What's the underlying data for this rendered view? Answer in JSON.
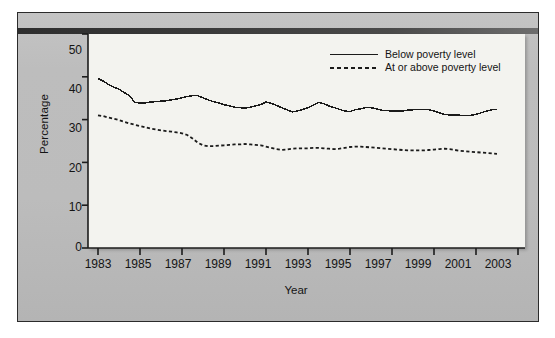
{
  "chart_data": {
    "type": "line",
    "title": "",
    "xlabel": "Year",
    "ylabel": "Percentage",
    "xlim": [
      1983,
      2003
    ],
    "ylim": [
      0,
      50
    ],
    "grid": false,
    "legend_position": "top-right",
    "x_ticks": [
      "1983",
      "1985",
      "1987",
      "1989",
      "1991",
      "1993",
      "1995",
      "1997",
      "1999",
      "2001",
      "2003"
    ],
    "y_ticks": [
      "0",
      "10",
      "20",
      "30",
      "40",
      "50"
    ],
    "series": [
      {
        "name": "Below poverty level",
        "style": "solid",
        "color": "#1a1a1a",
        "x": [
          1983.0,
          1983.25,
          1983.5,
          1983.75,
          1984.0,
          1984.25,
          1984.5,
          1984.75,
          1985.0,
          1985.25,
          1985.5,
          1985.75,
          1986.0,
          1986.25,
          1986.5,
          1986.75,
          1987.0,
          1987.25,
          1987.5,
          1987.75,
          1988.0,
          1988.25,
          1988.5,
          1988.75,
          1989.0,
          1989.25,
          1989.5,
          1989.75,
          1990.0,
          1990.25,
          1990.5,
          1990.75,
          1991.0,
          1991.25,
          1991.5,
          1991.75,
          1992.0,
          1992.25,
          1992.5,
          1992.75,
          1993.0,
          1993.25,
          1993.5,
          1993.75,
          1994.0,
          1994.25,
          1994.5,
          1994.75,
          1995.0,
          1995.25,
          1995.5,
          1995.75,
          1996.0,
          1996.25,
          1996.5,
          1996.75,
          1997.0,
          1997.25,
          1997.5,
          1997.75,
          1998.0,
          1998.25,
          1998.5,
          1998.75,
          1999.0,
          1999.25,
          1999.5,
          1999.75,
          2000.0,
          2000.25,
          2000.5,
          2000.75,
          2001.0,
          2001.25,
          2001.5,
          2001.75,
          2002.0
        ],
        "values": [
          39.6,
          39.0,
          38.2,
          37.6,
          37.1,
          36.3,
          35.6,
          34.0,
          33.9,
          33.9,
          34.1,
          34.2,
          34.3,
          34.4,
          34.6,
          34.8,
          35.1,
          35.4,
          35.6,
          35.6,
          35.1,
          34.6,
          34.2,
          33.9,
          33.5,
          33.2,
          32.9,
          32.8,
          32.7,
          32.9,
          33.2,
          33.5,
          34.1,
          33.8,
          33.3,
          32.8,
          32.3,
          31.8,
          32.0,
          32.4,
          32.8,
          33.4,
          34.0,
          33.7,
          33.2,
          32.8,
          32.4,
          32.0,
          31.9,
          32.3,
          32.5,
          32.8,
          32.8,
          32.5,
          32.2,
          32.1,
          32.0,
          32.0,
          32.0,
          32.2,
          32.3,
          32.4,
          32.4,
          32.3,
          32.0,
          31.6,
          31.2,
          31.1,
          31.1,
          31.0,
          31.0,
          31.0,
          31.2,
          31.6,
          32.0,
          32.3,
          32.4
        ]
      },
      {
        "name": "At or above poverty level",
        "style": "dotted",
        "color": "#1a1a1a",
        "x": [
          1983.0,
          1983.25,
          1983.5,
          1983.75,
          1984.0,
          1984.25,
          1984.5,
          1984.75,
          1985.0,
          1985.25,
          1985.5,
          1985.75,
          1986.0,
          1986.25,
          1986.5,
          1986.75,
          1987.0,
          1987.25,
          1987.5,
          1987.75,
          1988.0,
          1988.25,
          1988.5,
          1988.75,
          1989.0,
          1989.25,
          1989.5,
          1989.75,
          1990.0,
          1990.25,
          1990.5,
          1990.75,
          1991.0,
          1991.25,
          1991.5,
          1991.75,
          1992.0,
          1992.25,
          1992.5,
          1992.75,
          1993.0,
          1993.25,
          1993.5,
          1993.75,
          1994.0,
          1994.25,
          1994.5,
          1994.75,
          1995.0,
          1995.25,
          1995.5,
          1995.75,
          1996.0,
          1996.25,
          1996.5,
          1996.75,
          1997.0,
          1997.25,
          1997.5,
          1997.75,
          1998.0,
          1998.25,
          1998.5,
          1998.75,
          1999.0,
          1999.25,
          1999.5,
          1999.75,
          2000.0,
          2000.25,
          2000.5,
          2000.75,
          2001.0,
          2001.25,
          2001.5,
          2001.75,
          2002.0
        ],
        "values": [
          31.0,
          30.8,
          30.5,
          30.2,
          29.9,
          29.5,
          29.1,
          28.8,
          28.5,
          28.2,
          27.9,
          27.7,
          27.5,
          27.3,
          27.2,
          27.0,
          26.8,
          26.4,
          25.6,
          24.6,
          24.0,
          23.8,
          23.8,
          23.9,
          24.0,
          24.1,
          24.2,
          24.2,
          24.3,
          24.2,
          24.1,
          24.0,
          23.7,
          23.4,
          23.1,
          22.9,
          23.0,
          23.2,
          23.3,
          23.3,
          23.3,
          23.4,
          23.4,
          23.3,
          23.2,
          23.1,
          23.2,
          23.4,
          23.6,
          23.7,
          23.7,
          23.6,
          23.5,
          23.4,
          23.3,
          23.2,
          23.1,
          23.0,
          22.9,
          22.8,
          22.8,
          22.8,
          22.8,
          22.9,
          23.0,
          23.1,
          23.2,
          23.1,
          22.9,
          22.7,
          22.6,
          22.5,
          22.4,
          22.3,
          22.2,
          22.1,
          22.0
        ]
      }
    ]
  },
  "axes": {
    "y_label": "Percentage",
    "x_label": "Year",
    "y_ticks": [
      "50",
      "40",
      "30",
      "20",
      "10",
      "0"
    ],
    "x_ticks": [
      "1983",
      "1985",
      "1987",
      "1989",
      "1991",
      "1993",
      "1995",
      "1997",
      "1999",
      "2001",
      "2003"
    ]
  },
  "legend": {
    "items": [
      {
        "label": "Below poverty level",
        "style": "solid"
      },
      {
        "label": "At or above poverty level",
        "style": "dotted"
      }
    ]
  },
  "colors": {
    "line": "#1a1a1a",
    "plot_background": "#f3f3ef",
    "panel_background": "#bcbcbc",
    "text": "#141414"
  }
}
